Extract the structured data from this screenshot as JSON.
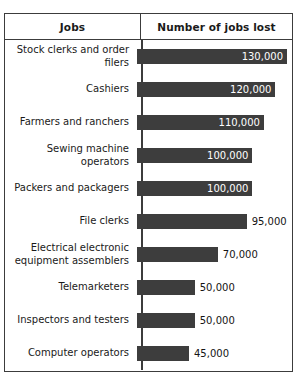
{
  "table": {
    "headers": {
      "jobs": "Jobs",
      "value": "Number of jobs lost"
    }
  },
  "chart_data": {
    "type": "bar",
    "orientation": "horizontal",
    "title": "",
    "xlabel": "Number of jobs lost",
    "ylabel": "Jobs",
    "grid": false,
    "legend": false,
    "bar_color": "#3d3d3d",
    "xlim": [
      0,
      130000
    ],
    "categories": [
      "Stock clerks and order filers",
      "Cashiers",
      "Farmers and ranchers",
      "Sewing machine operators",
      "Packers and packagers",
      "File clerks",
      "Electrical electronic equipment assemblers",
      "Telemarketers",
      "Inspectors and testers",
      "Computer operators"
    ],
    "values": [
      130000,
      120000,
      110000,
      100000,
      100000,
      95000,
      70000,
      50000,
      50000,
      45000
    ],
    "value_labels": [
      "130,000",
      "120,000",
      "110,000",
      "100,000",
      "100,000",
      "95,000",
      "70,000",
      "50,000",
      "50,000",
      "45,000"
    ],
    "rows": [
      {
        "label": "Stock clerks and order filers",
        "value": 130000,
        "value_label": "130,000",
        "label_inside": true
      },
      {
        "label": "Cashiers",
        "value": 120000,
        "value_label": "120,000",
        "label_inside": true
      },
      {
        "label": "Farmers and ranchers",
        "value": 110000,
        "value_label": "110,000",
        "label_inside": true
      },
      {
        "label": "Sewing machine operators",
        "value": 100000,
        "value_label": "100,000",
        "label_inside": true
      },
      {
        "label": "Packers and packagers",
        "value": 100000,
        "value_label": "100,000",
        "label_inside": true
      },
      {
        "label": "File clerks",
        "value": 95000,
        "value_label": "95,000",
        "label_inside": false
      },
      {
        "label": "Electrical electronic equipment assemblers",
        "value": 70000,
        "value_label": "70,000",
        "label_inside": false
      },
      {
        "label": "Telemarketers",
        "value": 50000,
        "value_label": "50,000",
        "label_inside": false
      },
      {
        "label": "Inspectors and testers",
        "value": 50000,
        "value_label": "50,000",
        "label_inside": false
      },
      {
        "label": "Computer operators",
        "value": 45000,
        "value_label": "45,000",
        "label_inside": false
      }
    ]
  }
}
